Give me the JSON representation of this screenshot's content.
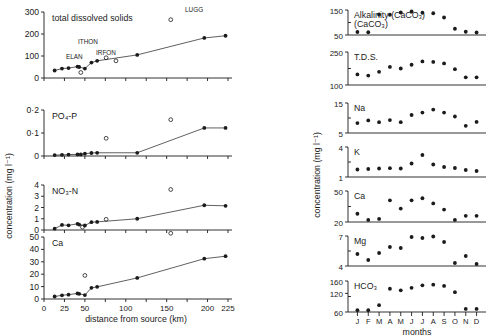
{
  "figure": {
    "left_group_axis_label": "concentration (mg l⁻¹)",
    "left_x_axis_label": "distance from source (km)",
    "right_group_axis_label": "concentration (mg l⁻¹)",
    "right_x_axis_label": "months",
    "month_labels": [
      "J",
      "F",
      "M",
      "A",
      "M",
      "J",
      "J",
      "A",
      "S",
      "O",
      "N",
      "D"
    ],
    "site_labels": [
      {
        "text": "LUGG",
        "x": 185,
        "y": 12
      },
      {
        "text": "ITHON",
        "x": 78,
        "y": 44
      },
      {
        "text": "ELAN",
        "x": 66,
        "y": 59
      },
      {
        "text": "IRFON",
        "x": 96,
        "y": 55
      }
    ]
  },
  "chart_data": [
    {
      "type": "line",
      "panel": "left-1",
      "title": "total dissolved solids",
      "xlabel": "distance from source (km)",
      "ylabel": "concentration (mg l⁻¹)",
      "xlim": [
        0,
        225
      ],
      "ylim": [
        0,
        300
      ],
      "yticks": [
        0,
        100,
        200,
        300
      ],
      "xticks": [
        0,
        25,
        50,
        75,
        100,
        125,
        150,
        175,
        200,
        225
      ],
      "series": [
        {
          "name": "main river (filled, joined)",
          "marker": "filled-circle",
          "x": [
            13,
            22,
            30,
            41,
            43,
            50,
            58,
            65,
            114,
            196,
            222
          ],
          "y": [
            34,
            43,
            45,
            52,
            50,
            43,
            70,
            78,
            105,
            182,
            192
          ]
        },
        {
          "name": "tributaries (open circles)",
          "marker": "open-circle",
          "x": [
            45,
            76,
            88,
            155
          ],
          "y": [
            25,
            92,
            78,
            265
          ],
          "labels": [
            "ELAN",
            "ITHON",
            "IRFON",
            "LUGG"
          ]
        }
      ]
    },
    {
      "type": "line",
      "panel": "left-2",
      "title": "PO₄-P",
      "xlabel": "distance from source (km)",
      "ylabel": "concentration (mg l⁻¹)",
      "xlim": [
        0,
        225
      ],
      "ylim": [
        0,
        0.2
      ],
      "yticks": [
        0,
        0.1,
        0.2
      ],
      "ytick_labels": [
        "0",
        "0·1",
        "0·2"
      ],
      "series": [
        {
          "name": "main river (filled, joined)",
          "marker": "filled-circle",
          "x": [
            13,
            22,
            30,
            41,
            45,
            50,
            58,
            65,
            114,
            196,
            222
          ],
          "y": [
            0.004,
            0.005,
            0.006,
            0.007,
            0.007,
            0.01,
            0.013,
            0.014,
            0.014,
            0.122,
            0.122
          ]
        },
        {
          "name": "tributaries (open circles)",
          "marker": "open-circle",
          "x": [
            76,
            155
          ],
          "y": [
            0.077,
            0.158
          ]
        }
      ]
    },
    {
      "type": "line",
      "panel": "left-3",
      "title": "NO₃-N",
      "xlabel": "distance from source (km)",
      "ylabel": "concentration (mg l⁻¹)",
      "xlim": [
        0,
        225
      ],
      "ylim": [
        0,
        4
      ],
      "yticks": [
        0,
        1,
        2,
        3,
        4
      ],
      "series": [
        {
          "name": "main river (filled, joined)",
          "marker": "filled-circle",
          "x": [
            13,
            22,
            30,
            41,
            43,
            50,
            58,
            65,
            114,
            196,
            222
          ],
          "y": [
            0.12,
            0.45,
            0.42,
            0.55,
            0.48,
            0.4,
            0.7,
            0.72,
            1.0,
            2.2,
            2.15
          ]
        },
        {
          "name": "tributaries (open circles)",
          "marker": "open-circle",
          "x": [
            47,
            76,
            155
          ],
          "y": [
            0.25,
            0.95,
            3.6
          ]
        }
      ]
    },
    {
      "type": "line",
      "panel": "left-4",
      "title": "Ca",
      "xlabel": "distance from source (km)",
      "ylabel": "concentration (mg l⁻¹)",
      "xlim": [
        0,
        225
      ],
      "ylim": [
        0,
        50
      ],
      "yticks": [
        0,
        10,
        20,
        30,
        40,
        50
      ],
      "series": [
        {
          "name": "main river (filled, joined)",
          "marker": "filled-circle",
          "x": [
            13,
            22,
            30,
            41,
            43,
            50,
            58,
            65,
            114,
            196,
            222
          ],
          "y": [
            2.0,
            3.0,
            3.5,
            4.5,
            4.2,
            3.2,
            9.0,
            9.8,
            17.0,
            32.5,
            34.5
          ]
        },
        {
          "name": "tributaries (open circles)",
          "marker": "open-circle",
          "x": [
            50,
            155
          ],
          "y": [
            19.0,
            53.0
          ]
        }
      ]
    },
    {
      "type": "scatter",
      "panel": "right-1",
      "title": "Alkalinity (CaCO₃)",
      "xlabel": "months",
      "ylabel": "concentration (mg l⁻¹)",
      "categories": [
        "J",
        "F",
        "M",
        "A",
        "M",
        "J",
        "J",
        "A",
        "S",
        "O",
        "N",
        "D"
      ],
      "ylim": [
        50,
        150
      ],
      "yticks": [
        50,
        150
      ],
      "values": [
        62,
        61,
        132,
        131,
        140,
        144,
        139,
        137,
        120,
        75,
        63,
        60
      ]
    },
    {
      "type": "scatter",
      "panel": "right-2",
      "title": "T.D.S.",
      "xlabel": "months",
      "ylabel": "concentration (mg l⁻¹)",
      "categories": [
        "J",
        "F",
        "M",
        "A",
        "M",
        "J",
        "J",
        "A",
        "S",
        "O",
        "N",
        "D"
      ],
      "ylim": [
        100,
        250
      ],
      "yticks": [
        100,
        250
      ],
      "values": [
        148,
        143,
        160,
        182,
        175,
        192,
        207,
        205,
        198,
        172,
        135,
        135,
        140
      ]
    },
    {
      "type": "scatter",
      "panel": "right-3",
      "title": "Na",
      "xlabel": "months",
      "ylabel": "concentration (mg l⁻¹)",
      "categories": [
        "J",
        "F",
        "M",
        "A",
        "M",
        "J",
        "J",
        "A",
        "S",
        "O",
        "N",
        "D"
      ],
      "ylim": [
        5,
        15
      ],
      "yticks": [
        5,
        15
      ],
      "values": [
        8.3,
        9.2,
        8.6,
        9.3,
        8.6,
        11.0,
        11.8,
        12.8,
        11.8,
        10.5,
        7.4,
        8.7,
        8.2
      ]
    },
    {
      "type": "scatter",
      "panel": "right-4",
      "title": "K",
      "xlabel": "months",
      "ylabel": "concentration (mg l⁻¹)",
      "categories": [
        "J",
        "F",
        "M",
        "A",
        "M",
        "J",
        "J",
        "A",
        "S",
        "O",
        "N",
        "D"
      ],
      "ylim": [
        1,
        4
      ],
      "yticks": [
        1,
        4
      ],
      "values": [
        1.75,
        1.8,
        1.85,
        1.88,
        1.85,
        2.35,
        3.2,
        2.25,
        2.0,
        1.9,
        1.7,
        1.6
      ]
    },
    {
      "type": "scatter",
      "panel": "right-5",
      "title": "Ca",
      "xlabel": "months",
      "ylabel": "concentration (mg l⁻¹)",
      "categories": [
        "J",
        "F",
        "M",
        "A",
        "M",
        "J",
        "J",
        "A",
        "S",
        "O",
        "N",
        "D"
      ],
      "ylim": [
        20,
        50
      ],
      "yticks": [
        20,
        50
      ],
      "values": [
        28,
        22,
        23,
        41,
        33,
        41,
        43,
        38,
        32,
        22,
        26,
        26
      ]
    },
    {
      "type": "scatter",
      "panel": "right-6",
      "title": "Mg",
      "xlabel": "months",
      "ylabel": "concentration (mg l⁻¹)",
      "categories": [
        "J",
        "F",
        "M",
        "A",
        "M",
        "J",
        "J",
        "A",
        "S",
        "O",
        "N",
        "D"
      ],
      "ylim": [
        4,
        7
      ],
      "yticks": [
        4,
        7
      ],
      "values": [
        5.2,
        4.6,
        5.3,
        5.9,
        5.8,
        6.9,
        6.8,
        6.95,
        6.4,
        4.3,
        5.0,
        4.2
      ]
    },
    {
      "type": "scatter",
      "panel": "right-7",
      "title": "HCO₃",
      "xlabel": "months",
      "ylabel": "concentration (mg l⁻¹)",
      "categories": [
        "J",
        "F",
        "M",
        "A",
        "M",
        "J",
        "J",
        "A",
        "S",
        "O",
        "N",
        "D"
      ],
      "ylim": [
        60,
        160
      ],
      "yticks": [
        60,
        120,
        160
      ],
      "values": [
        66,
        66,
        82,
        135,
        130,
        138,
        146,
        148,
        144,
        124,
        70,
        70,
        66
      ]
    }
  ]
}
